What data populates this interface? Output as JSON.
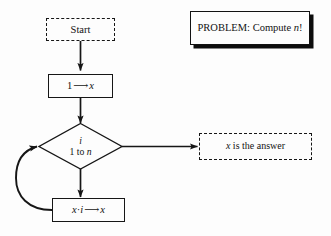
{
  "diagram": {
    "title_box": {
      "label": "PROBLEM: Compute n!",
      "prefix": "PROBLEM:",
      "compute_word": "Compute",
      "variable": "n",
      "factorial": "!"
    },
    "nodes": {
      "start": {
        "label": "Start",
        "shape": "dashed-rectangle"
      },
      "init": {
        "label": "1 ⟶ x",
        "operand": "1",
        "arrow": "⟶",
        "target": "x",
        "shape": "rectangle"
      },
      "loop": {
        "index": "i",
        "range": "1 to n",
        "range_prefix": "1 to",
        "range_var": "n",
        "shape": "diamond"
      },
      "answer": {
        "label": "x is the answer",
        "variable": "x",
        "text": "is the answer",
        "shape": "dashed-rectangle"
      },
      "body": {
        "label": "x · i ⟶ x",
        "left": "x",
        "dot": "·",
        "right": "i",
        "arrow": "⟶",
        "target": "x",
        "shape": "rectangle"
      }
    },
    "edges": [
      {
        "from": "start",
        "to": "init",
        "kind": "straight-down-arrow"
      },
      {
        "from": "init",
        "to": "loop",
        "kind": "straight-down-arrow"
      },
      {
        "from": "loop",
        "to": "answer",
        "kind": "straight-right-arrow"
      },
      {
        "from": "loop",
        "to": "body",
        "kind": "straight-down-arrow"
      },
      {
        "from": "body",
        "to": "loop",
        "kind": "curved-feedback-arrow"
      }
    ],
    "colors": {
      "ink": "#161616",
      "background": "#fdfdfd",
      "shadow": "#0d0d0d"
    }
  }
}
